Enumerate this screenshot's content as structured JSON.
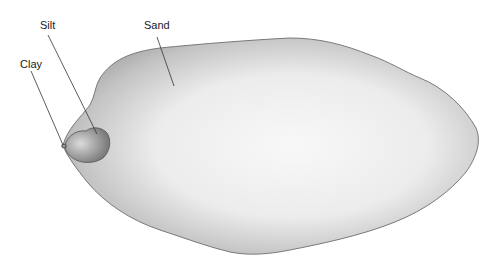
{
  "diagram": {
    "labels": {
      "clay": "Clay",
      "silt": "Silt",
      "sand": "Sand"
    },
    "colors": {
      "outline": "#7a7a7a",
      "sand_edge": "#a9a9a9",
      "sand_center": "#f7f7f7",
      "silt_fill": "#9a9a9a",
      "leader": "#333333"
    }
  }
}
